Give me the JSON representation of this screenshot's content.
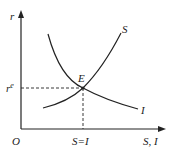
{
  "diagram": {
    "axes": {
      "y_label": "r",
      "x_label": "S, I",
      "origin_label": "O"
    },
    "curves": [
      {
        "name": "S",
        "label": "S",
        "shape": "increasing"
      },
      {
        "name": "I",
        "label": "I",
        "shape": "decreasing"
      }
    ],
    "equilibrium": {
      "label": "E",
      "r_label": "r",
      "r_sup": "e",
      "x_label": "S=I"
    },
    "colors": {
      "line": "#222222",
      "background": "#ffffff"
    }
  }
}
